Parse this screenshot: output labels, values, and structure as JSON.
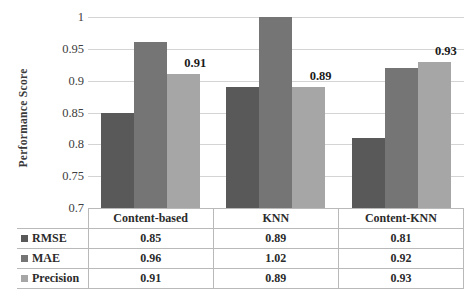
{
  "chart_data": {
    "type": "bar",
    "title": "",
    "xlabel": "",
    "ylabel": "Performance Score",
    "categories": [
      "Content-based",
      "KNN",
      "Content-KNN"
    ],
    "series": [
      {
        "name": "RMSE",
        "values": [
          0.85,
          0.89,
          0.81
        ],
        "color": "#595959"
      },
      {
        "name": "MAE",
        "values": [
          0.96,
          1.02,
          0.92
        ],
        "color": "#757575"
      },
      {
        "name": "Precision",
        "values": [
          0.91,
          0.89,
          0.93
        ],
        "color": "#a6a6a6"
      }
    ],
    "ylim": [
      0.7,
      1.0
    ],
    "yticks": [
      "0.7",
      "0.75",
      "0.8",
      "0.85",
      "0.9",
      "0.95",
      "1"
    ],
    "grid": true,
    "legend_position": "table-left",
    "data_labels": {
      "series": "Precision",
      "values": [
        "0.91",
        "0.89",
        "0.93"
      ]
    },
    "clipped_note": "MAE / KNN bar value 1.02 exceeds axis max and is clipped at 1"
  },
  "table": {
    "header": [
      "",
      "Content-based",
      "KNN",
      "Content-KNN"
    ],
    "rows": [
      {
        "label": "RMSE",
        "values": [
          "0.85",
          "0.89",
          "0.81"
        ]
      },
      {
        "label": "MAE",
        "values": [
          "0.96",
          "1.02",
          "0.92"
        ]
      },
      {
        "label": "Precision",
        "values": [
          "0.91",
          "0.89",
          "0.93"
        ]
      }
    ]
  },
  "colors": {
    "series_rmse": "#595959",
    "series_mae": "#757575",
    "series_precision": "#a6a6a6",
    "grid": "#d4d4d4",
    "table_border": "#b9b9b9",
    "text": "#2b2b2b"
  }
}
